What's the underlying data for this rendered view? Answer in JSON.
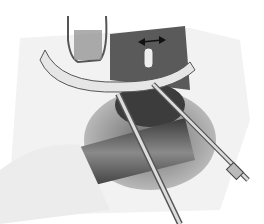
{
  "illustration": {
    "subject": "surgical illustration",
    "style": "grayscale pencil drawing",
    "elements": [
      "retractor-hook",
      "curved-vessel",
      "double-arrow",
      "probe-left",
      "probe-right",
      "tubular-structure",
      "tissue-opening"
    ],
    "colors": {
      "background": "#ffffff",
      "dark": "#2a2a2a",
      "mid": "#7a7a7a",
      "light": "#d8d8d8"
    }
  }
}
